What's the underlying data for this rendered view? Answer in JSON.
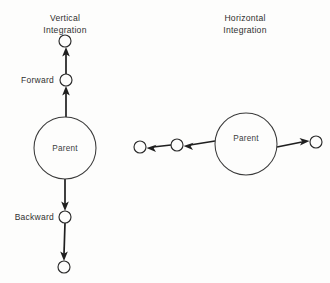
{
  "figure": {
    "background_color": "#fdfdfc",
    "stroke_color": "#1f1f1f",
    "text_color": "#333333",
    "panels": [
      {
        "id": "vertical",
        "title_line1": "Vertical",
        "title_line2": "Integration",
        "parent_label": "Parent",
        "labels": {
          "forward": "Forward",
          "backward": "Backward"
        },
        "nodes": [
          {
            "name": "top-terminal-node",
            "cx": 65,
            "cy": 41,
            "r": 6
          },
          {
            "name": "forward-node",
            "cx": 66,
            "cy": 80,
            "r": 6
          },
          {
            "name": "parent-node",
            "cx": 65,
            "cy": 148,
            "r": 31
          },
          {
            "name": "backward-node",
            "cx": 65,
            "cy": 217,
            "r": 6
          },
          {
            "name": "bottom-terminal-node",
            "cx": 64,
            "cy": 267,
            "r": 6
          }
        ],
        "edges": [
          {
            "name": "parent-to-forward",
            "direction": "up"
          },
          {
            "name": "forward-to-top",
            "direction": "up"
          },
          {
            "name": "parent-to-backward",
            "direction": "down"
          },
          {
            "name": "backward-to-bottom",
            "direction": "down"
          }
        ]
      },
      {
        "id": "horizontal",
        "title_line1": "Horizontal",
        "title_line2": "Integration",
        "parent_label": "Parent",
        "labels": {},
        "nodes": [
          {
            "name": "far-left-node",
            "cx": 140,
            "cy": 147,
            "r": 6
          },
          {
            "name": "mid-left-node",
            "cx": 177,
            "cy": 145,
            "r": 6
          },
          {
            "name": "parent-node",
            "cx": 246,
            "cy": 144,
            "r": 31
          },
          {
            "name": "right-node",
            "cx": 316,
            "cy": 142,
            "r": 6
          }
        ],
        "edges": [
          {
            "name": "parent-to-mid-left",
            "direction": "left"
          },
          {
            "name": "mid-left-to-far-left",
            "direction": "left"
          },
          {
            "name": "parent-to-right",
            "direction": "right"
          }
        ]
      }
    ]
  }
}
